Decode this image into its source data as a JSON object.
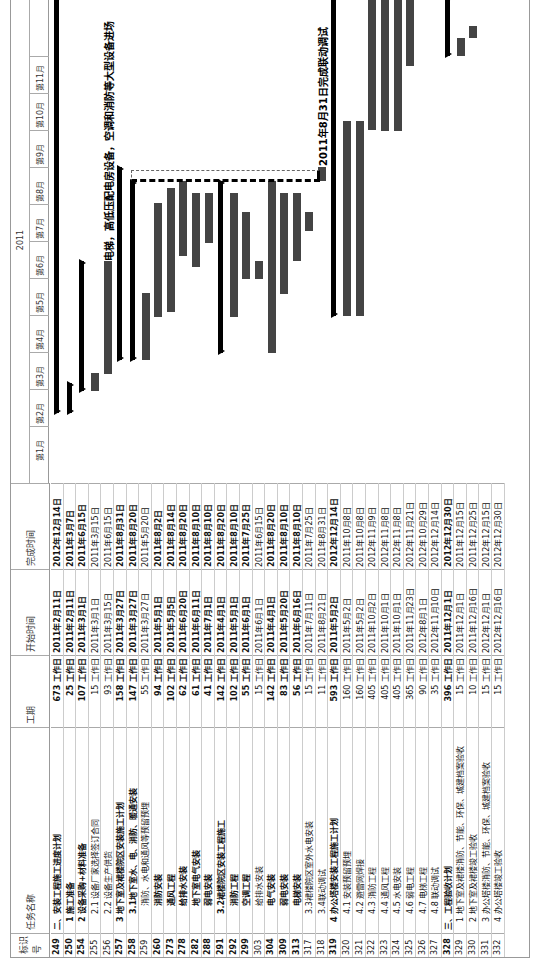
{
  "columns": {
    "id": "标识号",
    "name": "任务名称",
    "duration": "工期",
    "start": "开始时间",
    "finish": "完成时间"
  },
  "timeline": {
    "year": "2011",
    "months": [
      "第1月",
      "第2月",
      "第3月",
      "第4月",
      "第5月",
      "第6月",
      "第7月",
      "第8月",
      "第9月",
      "第10月",
      "第11月"
    ]
  },
  "annotations": {
    "equipment": "电梯，高低压配电房设备，空调和消防等大型设备进场",
    "commissioning": "2011年8月31日完成联动调试"
  },
  "chart_data": {
    "type": "table",
    "title": "",
    "columns": [
      "标识号",
      "任务名称",
      "工期",
      "开始时间",
      "完成时间"
    ],
    "rows": [
      {
        "id": "249",
        "name": "二、安装工程施工进度计划",
        "duration": "673 工作日",
        "start": "2011年2月11日",
        "finish": "2012年12月14日",
        "bold": true,
        "indent": 0
      },
      {
        "id": "250",
        "name": "1 施工准备",
        "duration": "25 工作日",
        "start": "2011年2月11日",
        "finish": "2011年3月7日",
        "bold": true,
        "indent": 1
      },
      {
        "id": "254",
        "name": "2 设备采购+材料准备",
        "duration": "107 工作日",
        "start": "2011年3月1日",
        "finish": "2011年6月15日",
        "bold": true,
        "indent": 1
      },
      {
        "id": "255",
        "name": "2.1 设备厂家选择签订合同",
        "duration": "15 工作日",
        "start": "2011年3月1日",
        "finish": "2011年3月15日",
        "bold": false,
        "indent": 2
      },
      {
        "id": "256",
        "name": "2.2 设备生产供货",
        "duration": "93 工作日",
        "start": "2011年3月15日",
        "finish": "2011年6月15日",
        "bold": false,
        "indent": 2
      },
      {
        "id": "257",
        "name": "3 地下室及裙楼院区安装施工计划",
        "duration": "158 工作日",
        "start": "2011年3月27日",
        "finish": "2011年8月31日",
        "bold": true,
        "indent": 1
      },
      {
        "id": "258",
        "name": "3.1地下室水、电、消防、暖通安装",
        "duration": "147 工作日",
        "start": "2011年3月27日",
        "finish": "2011年8月20日",
        "bold": true,
        "indent": 2
      },
      {
        "id": "259",
        "name": "消防、水电和通风等预留预埋",
        "duration": "55 工作日",
        "start": "2011年3月27日",
        "finish": "2011年5月20日",
        "bold": false,
        "indent": 3
      },
      {
        "id": "260",
        "name": "消防安装",
        "duration": "94 工作日",
        "start": "2011年5月1日",
        "finish": "2011年8月2日",
        "bold": true,
        "indent": 3
      },
      {
        "id": "273",
        "name": "通风工程",
        "duration": "102 工作日",
        "start": "2011年5月5日",
        "finish": "2011年8月14日",
        "bold": true,
        "indent": 3
      },
      {
        "id": "278",
        "name": "给排水安装",
        "duration": "62 工作日",
        "start": "2011年6月20日",
        "finish": "2011年8月20日",
        "bold": true,
        "indent": 3
      },
      {
        "id": "282",
        "name": "地下室电气安装",
        "duration": "61 工作日",
        "start": "2011年6月11日",
        "finish": "2011年8月10日",
        "bold": true,
        "indent": 3
      },
      {
        "id": "288",
        "name": "弱电安装",
        "duration": "41 工作日",
        "start": "2011年7月1日",
        "finish": "2011年8月10日",
        "bold": true,
        "indent": 3
      },
      {
        "id": "291",
        "name": "3.2裙楼院区安装工程施工",
        "duration": "142 工作日",
        "start": "2011年4月1日",
        "finish": "2011年8月20日",
        "bold": true,
        "indent": 2
      },
      {
        "id": "292",
        "name": "消防工程",
        "duration": "102 工作日",
        "start": "2011年5月1日",
        "finish": "2011年8月10日",
        "bold": true,
        "indent": 3
      },
      {
        "id": "299",
        "name": "空调工程",
        "duration": "55 工作日",
        "start": "2011年6月1日",
        "finish": "2011年7月25日",
        "bold": true,
        "indent": 3
      },
      {
        "id": "303",
        "name": "给排水安装",
        "duration": "15 工作日",
        "start": "2011年6月1日",
        "finish": "2011年6月15日",
        "bold": false,
        "indent": 3
      },
      {
        "id": "304",
        "name": "电气安装",
        "duration": "142 工作日",
        "start": "2011年4月1日",
        "finish": "2011年8月20日",
        "bold": true,
        "indent": 3
      },
      {
        "id": "309",
        "name": "弱电安装",
        "duration": "83 工作日",
        "start": "2011年5月20日",
        "finish": "2011年8月10日",
        "bold": true,
        "indent": 3
      },
      {
        "id": "313",
        "name": "电梯安装",
        "duration": "56 工作日",
        "start": "2011年6月16日",
        "finish": "2011年8月10日",
        "bold": true,
        "indent": 3
      },
      {
        "id": "317",
        "name": "3.3裙楼院区室外水电安装",
        "duration": "15 工作日",
        "start": "2011年7月11日",
        "finish": "2011年7月25日",
        "bold": false,
        "indent": 2
      },
      {
        "id": "318",
        "name": "3.4联动调试",
        "duration": "11 工作日",
        "start": "2011年8月21日",
        "finish": "2011年8月31日",
        "bold": false,
        "indent": 2
      },
      {
        "id": "319",
        "name": "4 办公塔楼安装工程施工计划",
        "duration": "593 工作日",
        "start": "2011年5月2日",
        "finish": "2012年12月14日",
        "bold": true,
        "indent": 1
      },
      {
        "id": "320",
        "name": "4.1 安装预留预埋",
        "duration": "160 工作日",
        "start": "2011年5月2日",
        "finish": "2011年10月8日",
        "bold": false,
        "indent": 2
      },
      {
        "id": "321",
        "name": "4.2 避雷网焊接",
        "duration": "160 工作日",
        "start": "2011年5月2日",
        "finish": "2011年10月8日",
        "bold": false,
        "indent": 2
      },
      {
        "id": "322",
        "name": "4.3 消防工程",
        "duration": "405 工作日",
        "start": "2011年10月2日",
        "finish": "2012年11月9日",
        "bold": false,
        "indent": 2
      },
      {
        "id": "323",
        "name": "4.4 通风工程",
        "duration": "405 工作日",
        "start": "2011年10月1日",
        "finish": "2012年11月8日",
        "bold": false,
        "indent": 2
      },
      {
        "id": "324",
        "name": "4.5 水电安装",
        "duration": "405 工作日",
        "start": "2011年10月1日",
        "finish": "2012年11月8日",
        "bold": false,
        "indent": 2
      },
      {
        "id": "325",
        "name": "4.6 弱电工程",
        "duration": "365 工作日",
        "start": "2011年11月23日",
        "finish": "2012年11月21日",
        "bold": false,
        "indent": 2
      },
      {
        "id": "326",
        "name": "4.7 电梯工程",
        "duration": "90 工作日",
        "start": "2012年8月1日",
        "finish": "2012年10月29日",
        "bold": false,
        "indent": 2
      },
      {
        "id": "327",
        "name": "4.8 联动调试",
        "duration": "35 工作日",
        "start": "2012年11月10日",
        "finish": "2012年12月14日",
        "bold": false,
        "indent": 2
      },
      {
        "id": "328",
        "name": "三、工程验收计划",
        "duration": "396 工作日",
        "start": "2011年12月1日",
        "finish": "2012年12月30日",
        "bold": true,
        "indent": 0
      },
      {
        "id": "329",
        "name": "1 地下室及裙楼消防、节能、环保、城建档案验收",
        "duration": "15 工作日",
        "start": "2011年12月1日",
        "finish": "2011年12月15日",
        "bold": false,
        "indent": 1
      },
      {
        "id": "330",
        "name": "2 地下室及裙楼竣工验收",
        "duration": "10 工作日",
        "start": "2011年12月16日",
        "finish": "2011年12月25日",
        "bold": false,
        "indent": 1
      },
      {
        "id": "331",
        "name": "3 办公塔楼消防、节能、环保、城建档案验收",
        "duration": "15 工作日",
        "start": "2012年12月1日",
        "finish": "2012年12月15日",
        "bold": false,
        "indent": 1
      },
      {
        "id": "332",
        "name": "4 办公塔楼竣工验收",
        "duration": "15 工作日",
        "start": "2012年12月16日",
        "finish": "2012年12月30日",
        "bold": false,
        "indent": 1
      }
    ],
    "gantt": {
      "axis_year": "2011",
      "axis_months": [
        "第1月",
        "第2月",
        "第3月",
        "第4月",
        "第5月",
        "第6月",
        "第7月",
        "第8月",
        "第9月",
        "第10月",
        "第11月"
      ],
      "grid": false
    }
  }
}
